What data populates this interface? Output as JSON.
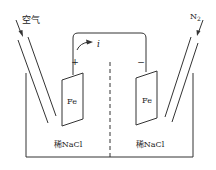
{
  "diagram": {
    "inlets": {
      "left": {
        "label": "空气"
      },
      "right": {
        "label": "N",
        "subscript": "2"
      }
    },
    "wire": {
      "current_label": "i"
    },
    "electrodes": {
      "left": {
        "label": "Fe",
        "polarity": "+"
      },
      "right": {
        "label": "Fe",
        "polarity": "−"
      }
    },
    "solutions": {
      "left": "稀NaCl",
      "right": "稀NaCl"
    },
    "colors": {
      "stroke": "#333333",
      "background": "#ffffff"
    }
  }
}
